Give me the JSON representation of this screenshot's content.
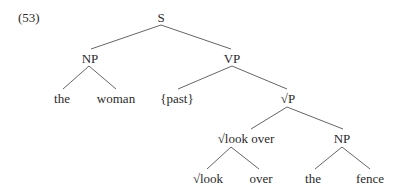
{
  "example_number": "(53)",
  "tree": {
    "S": "S",
    "NP_subject": "NP",
    "the_1": "the",
    "woman": "woman",
    "VP": "VP",
    "past": "{past}",
    "rootP": "√P",
    "look_over": "√look over",
    "look": "√look",
    "over": "over",
    "NP_object": "NP",
    "the_2": "the",
    "fence": "fence"
  },
  "colors": {
    "line": "#555555",
    "text": "#2a2a2a"
  }
}
